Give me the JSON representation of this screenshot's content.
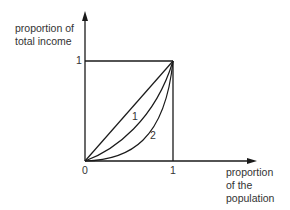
{
  "diagram": {
    "type": "lorenz-curve",
    "y_axis": {
      "label_line1": "proportion of",
      "label_line2": "total income",
      "tick_1": "1"
    },
    "x_axis": {
      "label_line1": "proportion",
      "label_line2": "of the",
      "label_line3": "population",
      "tick_0": "0",
      "tick_1": "1"
    },
    "curves": [
      {
        "id": "equality-line",
        "label": ""
      },
      {
        "id": "curve-1",
        "label": "1"
      },
      {
        "id": "curve-2",
        "label": "2"
      }
    ],
    "colors": {
      "line": "#1a1a1a",
      "background": "#ffffff"
    }
  }
}
